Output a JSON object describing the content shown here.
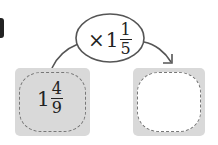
{
  "problem": {
    "number_glyph": "partial-number",
    "operation": {
      "symbol": "×",
      "whole": "1",
      "numerator": "1",
      "denominator": "5"
    },
    "input_box": {
      "whole": "1",
      "numerator": "4",
      "denominator": "9"
    },
    "output_box": {
      "value": ""
    }
  },
  "colors": {
    "box_fill": "#d9d9d9",
    "dash": "#777777",
    "line": "#555555",
    "text": "#222222"
  }
}
